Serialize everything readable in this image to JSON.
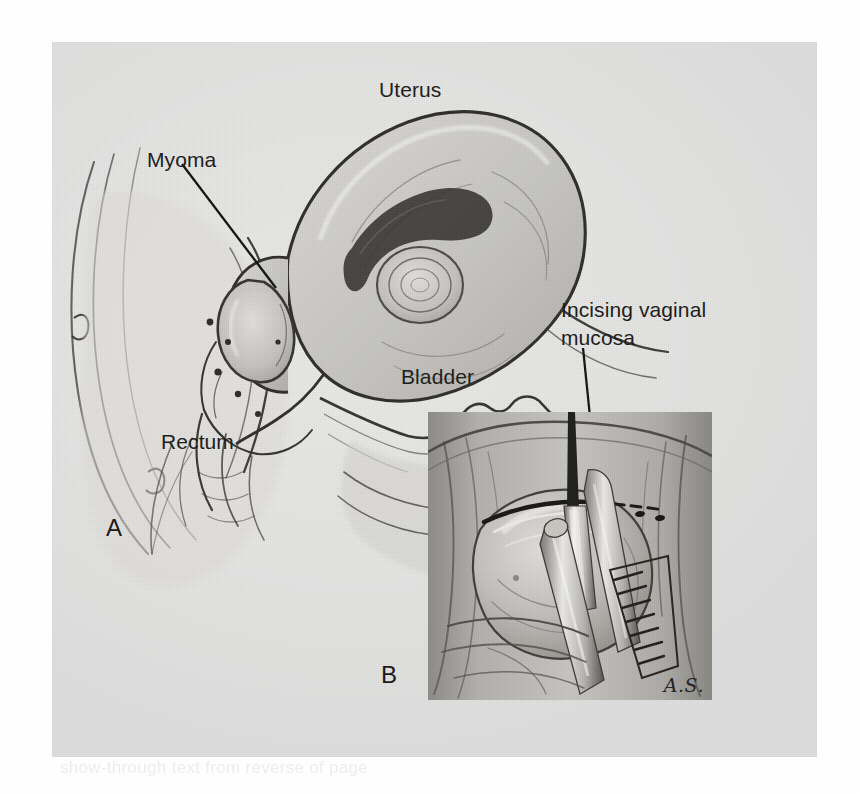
{
  "figure": {
    "type": "medical-illustration",
    "background_color": "#e4e4e2",
    "page_color": "#ffffff",
    "ink_color": "#1b1b1b"
  },
  "panel_a": {
    "panel_label": "A",
    "labels": {
      "uterus": "Uterus",
      "myoma": "Myoma",
      "bladder": "Bladder",
      "rectum": "Rectum"
    }
  },
  "panel_b": {
    "panel_label": "B",
    "labels": {
      "incising_line1": "Incising vaginal",
      "incising_line2": "mucosa"
    },
    "signature": "A.S."
  },
  "ghost_text": "show-through text from reverse of page"
}
